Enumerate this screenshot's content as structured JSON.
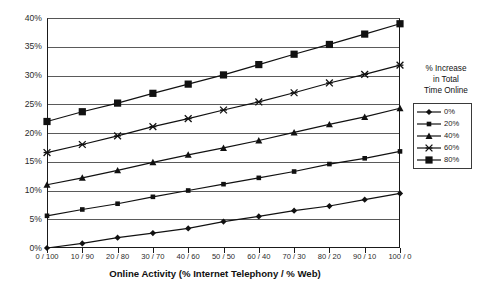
{
  "chart_data": {
    "type": "line",
    "title": "",
    "xlabel": "Online Activity (% Internet Telephony / % Web)",
    "ylabel": "",
    "legend_title_lines": [
      "% Increase",
      "in  Total",
      "Time Online"
    ],
    "legend_position": "right",
    "grid": true,
    "categories": [
      "0 / 100",
      "10 / 90",
      "20 / 80",
      "30 / 70",
      "40 / 60",
      "50 / 50",
      "60 / 40",
      "70 / 30",
      "80 / 20",
      "90 / 10",
      "100 / 0"
    ],
    "ylim": [
      0,
      40
    ],
    "yticks": [
      "0%",
      "5%",
      "10%",
      "15%",
      "20%",
      "25%",
      "30%",
      "35%",
      "40%"
    ],
    "ytick_values": [
      0,
      5,
      10,
      15,
      20,
      25,
      30,
      35,
      40
    ],
    "series": [
      {
        "name": "0%",
        "marker": "diamond",
        "color": "#111111",
        "values": [
          0.0,
          0.8,
          1.8,
          2.6,
          3.4,
          4.6,
          5.5,
          6.5,
          7.3,
          8.4,
          9.5
        ]
      },
      {
        "name": "20%",
        "marker": "square-small",
        "color": "#111111",
        "values": [
          5.6,
          6.7,
          7.7,
          8.9,
          10.0,
          11.1,
          12.2,
          13.3,
          14.6,
          15.6,
          16.8
        ]
      },
      {
        "name": "40%",
        "marker": "triangle",
        "color": "#111111",
        "values": [
          11.0,
          12.2,
          13.5,
          14.9,
          16.2,
          17.4,
          18.7,
          20.1,
          21.5,
          22.8,
          24.3
        ]
      },
      {
        "name": "60%",
        "marker": "cross-x",
        "color": "#111111",
        "values": [
          16.6,
          18.0,
          19.5,
          21.1,
          22.5,
          24.0,
          25.4,
          27.0,
          28.7,
          30.2,
          31.8
        ]
      },
      {
        "name": "80%",
        "marker": "square-large",
        "color": "#111111",
        "values": [
          22.0,
          23.7,
          25.2,
          26.9,
          28.5,
          30.1,
          31.9,
          33.7,
          35.4,
          37.2,
          39.0
        ]
      }
    ]
  }
}
